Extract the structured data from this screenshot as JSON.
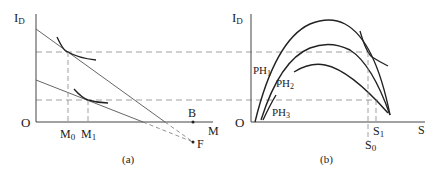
{
  "figure": {
    "colors": {
      "ink": "#222222",
      "line": "#555555",
      "dash": "#888888",
      "background": "#ffffff"
    },
    "panel_a": {
      "caption": "(a)",
      "y_axis_label": "I",
      "y_axis_sub": "D",
      "origin_label": "O",
      "x_axis_label": "M",
      "ticks": [
        {
          "main": "M",
          "sub": "0"
        },
        {
          "main": "M",
          "sub": "1"
        }
      ],
      "point_b": "B",
      "point_f": "F"
    },
    "panel_b": {
      "caption": "(b)",
      "y_axis_label": "I",
      "y_axis_sub": "D",
      "origin_label": "O",
      "x_axis_label": "S",
      "curves": [
        {
          "main": "PH",
          "sub": "1"
        },
        {
          "main": "PH",
          "sub": "2"
        },
        {
          "main": "PH",
          "sub": "3"
        }
      ],
      "ticks": [
        {
          "main": "S",
          "sub": "0"
        },
        {
          "main": "S",
          "sub": "1"
        }
      ]
    }
  }
}
